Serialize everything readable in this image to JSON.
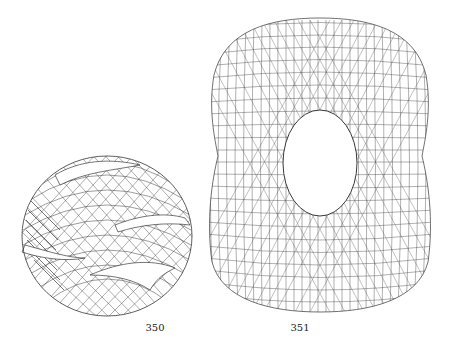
{
  "figures": [
    {
      "number": "350",
      "description": "wireframe surface, sphere-like ball with twisted slit bands",
      "line_color": "#1a1a1a"
    },
    {
      "number": "351",
      "description": "wireframe surface, peanut/figure-eight shaped torus with central elliptical hole",
      "line_color": "#333333"
    }
  ]
}
